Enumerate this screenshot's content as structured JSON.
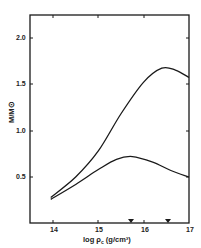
{
  "chart_data": {
    "type": "line",
    "title": "",
    "xlabel": "log ρc (g/cm³)",
    "ylabel": "M/M⊙",
    "xlim": [
      13.5,
      17
    ],
    "ylim": [
      0,
      2.25
    ],
    "x_ticks": [
      "14",
      "15",
      "16",
      "17"
    ],
    "y_ticks": [
      "0.5",
      "1.0",
      "1.5",
      "2.0"
    ],
    "grid": false,
    "legend": null,
    "markers": [
      {
        "shape": "filled-triangle-down",
        "x": 15.75
      },
      {
        "shape": "filled-triangle-down",
        "x": 16.55
      }
    ],
    "series": [
      {
        "name": "upper curve",
        "x": [
          13.95,
          14.5,
          15.0,
          15.5,
          16.0,
          16.4,
          16.7,
          17.0
        ],
        "y": [
          0.28,
          0.5,
          0.78,
          1.18,
          1.52,
          1.67,
          1.65,
          1.57
        ]
      },
      {
        "name": "lower curve",
        "x": [
          13.95,
          14.5,
          15.0,
          15.4,
          15.75,
          16.2,
          16.6,
          17.0
        ],
        "y": [
          0.26,
          0.42,
          0.58,
          0.69,
          0.72,
          0.66,
          0.57,
          0.5
        ]
      }
    ]
  },
  "labels": {
    "ylabel": "M/M⊙",
    "xlabel_main": "log ρ",
    "xlabel_sub": "c",
    "xlabel_unit": " (g/cm³)",
    "yticks": [
      "2.0",
      "1.5",
      "1.0",
      "0.5"
    ],
    "xticks": [
      "14",
      "15",
      "16",
      "17"
    ]
  }
}
